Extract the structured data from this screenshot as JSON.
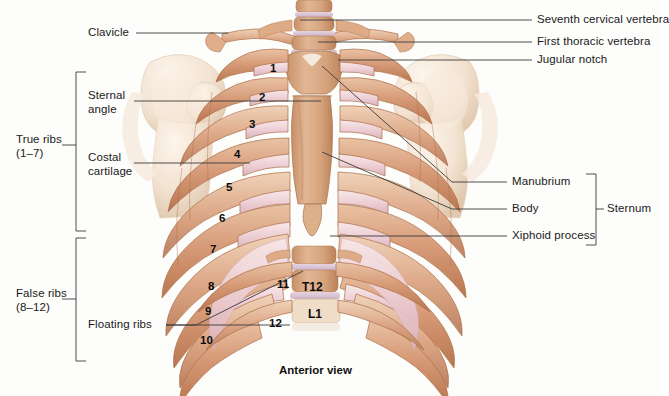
{
  "figure": {
    "caption": "Anterior view",
    "background_color": "#fdfdfb"
  },
  "colors": {
    "bone_rib": "#d9a183",
    "bone_rib_dark": "#b97a56",
    "bone_rib_light": "#e8c4a8",
    "cartilage_pink": "#eccfd4",
    "cartilage_pink_light": "#f6e3e6",
    "bone_pale": "#f2e3d5",
    "vertebra": "#cf9f7c",
    "disc": "#dcc8d6",
    "leader_line": "#3a3a3a",
    "text": "#1a1a1a"
  },
  "labels_left": [
    {
      "id": "clavicle",
      "text": "Clavicle",
      "x": 88,
      "y": 33
    },
    {
      "id": "sternal-angle",
      "text": "Sternal\nangle",
      "line1": "Sternal",
      "line2": "angle",
      "x": 88,
      "y": 96
    },
    {
      "id": "costal-cartilage",
      "text": "Costal\ncartilage",
      "line1": "Costal",
      "line2": "cartilage",
      "x": 88,
      "y": 157
    },
    {
      "id": "true-ribs",
      "text": "True ribs\n(1–7)",
      "line1": "True ribs",
      "line2": "(1–7)",
      "x": 18,
      "y": 140
    },
    {
      "id": "false-ribs",
      "text": "False ribs\n(8–12)",
      "line1": "False ribs",
      "line2": "(8–12)",
      "x": 18,
      "y": 294
    },
    {
      "id": "floating-ribs",
      "text": "Floating ribs",
      "x": 88,
      "y": 325
    }
  ],
  "labels_right": [
    {
      "id": "seventh-cervical-vertebra",
      "text": "Seventh cervical vertebra",
      "x": 537,
      "y": 20
    },
    {
      "id": "first-thoracic-vertebra",
      "text": "First thoracic vertebra",
      "x": 537,
      "y": 42
    },
    {
      "id": "jugular-notch",
      "text": "Jugular notch",
      "x": 537,
      "y": 60
    },
    {
      "id": "manubrium",
      "text": "Manubrium",
      "x": 512,
      "y": 182
    },
    {
      "id": "body",
      "text": "Body",
      "x": 512,
      "y": 209
    },
    {
      "id": "xiphoid-process",
      "text": "Xiphoid process",
      "x": 512,
      "y": 236
    },
    {
      "id": "sternum",
      "text": "Sternum",
      "x": 607,
      "y": 209
    }
  ],
  "rib_numbers": [
    {
      "n": "1",
      "x": 270,
      "y": 62
    },
    {
      "n": "2",
      "x": 259,
      "y": 91
    },
    {
      "n": "3",
      "x": 249,
      "y": 118
    },
    {
      "n": "4",
      "x": 234,
      "y": 148
    },
    {
      "n": "5",
      "x": 226,
      "y": 181
    },
    {
      "n": "6",
      "x": 219,
      "y": 212
    },
    {
      "n": "7",
      "x": 210,
      "y": 243
    },
    {
      "n": "8",
      "x": 208,
      "y": 280
    },
    {
      "n": "9",
      "x": 205,
      "y": 305
    },
    {
      "n": "10",
      "x": 202,
      "y": 334
    },
    {
      "n": "11",
      "x": 279,
      "y": 278
    },
    {
      "n": "12",
      "x": 271,
      "y": 317
    }
  ],
  "vertebra_labels": [
    {
      "id": "t12",
      "text": "T12",
      "x": 310,
      "y": 287
    },
    {
      "id": "l1",
      "text": "L1",
      "x": 314,
      "y": 314
    }
  ],
  "brackets": {
    "true_ribs": {
      "x": 76,
      "top": 72,
      "bottom": 231,
      "tick_y": 145,
      "tick_to": 62
    },
    "false_ribs": {
      "x": 76,
      "top": 238,
      "bottom": 361,
      "tick_y": 299,
      "tick_to": 62
    },
    "sternum": {
      "x": 596,
      "top": 174,
      "bottom": 245,
      "tick_y": 209,
      "tick_to": 604
    }
  },
  "leader_lines": [
    {
      "id": "clavicle-leader",
      "points": "135,33 222,33"
    },
    {
      "id": "sternal-angle-leader",
      "points": "133,101 319,101"
    },
    {
      "id": "costal-cartilage-leader",
      "points": "133,163 245,163"
    },
    {
      "id": "floating-ribs-a",
      "points": "168,325 196,325 303,270"
    },
    {
      "id": "floating-ribs-b",
      "points": "168,325 288,325"
    },
    {
      "id": "c7-leader",
      "points": "532,20 300,20"
    },
    {
      "id": "t1-leader",
      "points": "532,42 316,43"
    },
    {
      "id": "jugular-leader",
      "points": "532,60 336,60"
    },
    {
      "id": "manubrium-leader",
      "points": "507,182 449,182 322,66"
    },
    {
      "id": "body-leader",
      "points": "507,209 449,209 323,152"
    },
    {
      "id": "xiphoid-leader",
      "points": "507,236 328,236"
    }
  ],
  "caption": {
    "text": "Anterior view",
    "x": 279,
    "y": 371
  }
}
